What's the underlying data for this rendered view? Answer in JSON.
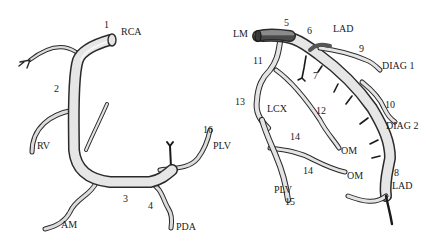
{
  "figure": {
    "left_panel": {
      "name": "right-coronary-artery",
      "labels": [
        {
          "id": "seg-1",
          "text": "1",
          "x": 104,
          "y": 24
        },
        {
          "id": "rca",
          "text": "RCA",
          "x": 121,
          "y": 30
        },
        {
          "id": "seg-2",
          "text": "2",
          "x": 54,
          "y": 85
        },
        {
          "id": "rv",
          "text": "RV",
          "x": 37,
          "y": 142
        },
        {
          "id": "seg-16",
          "text": "16",
          "x": 203,
          "y": 126
        },
        {
          "id": "plv",
          "text": "PLV",
          "x": 213,
          "y": 142
        },
        {
          "id": "seg-3",
          "text": "3",
          "x": 123,
          "y": 195
        },
        {
          "id": "seg-4",
          "text": "4",
          "x": 148,
          "y": 203
        },
        {
          "id": "am",
          "text": "AM",
          "x": 61,
          "y": 222
        },
        {
          "id": "pda",
          "text": "PDA",
          "x": 176,
          "y": 224
        }
      ]
    },
    "right_panel": {
      "name": "left-coronary-artery",
      "labels": [
        {
          "id": "lm",
          "text": "LM",
          "x": 233,
          "y": 30
        },
        {
          "id": "seg-5",
          "text": "5",
          "x": 284,
          "y": 20
        },
        {
          "id": "seg-6",
          "text": "6",
          "x": 307,
          "y": 27
        },
        {
          "id": "lad-top",
          "text": "LAD",
          "x": 333,
          "y": 25
        },
        {
          "id": "seg-9",
          "text": "9",
          "x": 359,
          "y": 45
        },
        {
          "id": "diag-1",
          "text": "DIAG 1",
          "x": 382,
          "y": 60
        },
        {
          "id": "seg-11",
          "text": "11",
          "x": 253,
          "y": 57
        },
        {
          "id": "seg-7",
          "text": "7",
          "x": 313,
          "y": 72
        },
        {
          "id": "seg-13",
          "text": "13",
          "x": 235,
          "y": 98
        },
        {
          "id": "lcx",
          "text": "LCX",
          "x": 267,
          "y": 104
        },
        {
          "id": "seg-12",
          "text": "12",
          "x": 316,
          "y": 106
        },
        {
          "id": "seg-10",
          "text": "10",
          "x": 385,
          "y": 101
        },
        {
          "id": "diag-2",
          "text": "DIAG 2",
          "x": 386,
          "y": 122
        },
        {
          "id": "seg-14-upper",
          "text": "14",
          "x": 290,
          "y": 134
        },
        {
          "id": "om-upper",
          "text": "OM",
          "x": 341,
          "y": 147
        },
        {
          "id": "seg-14-lower",
          "text": "14",
          "x": 303,
          "y": 167
        },
        {
          "id": "om-lower",
          "text": "OM",
          "x": 347,
          "y": 171
        },
        {
          "id": "seg-8",
          "text": "8",
          "x": 394,
          "y": 168
        },
        {
          "id": "lad-bottom",
          "text": "LAD",
          "x": 392,
          "y": 182
        },
        {
          "id": "plv-lower",
          "text": "PLV",
          "x": 274,
          "y": 186
        },
        {
          "id": "seg-15",
          "text": "15",
          "x": 285,
          "y": 198
        }
      ]
    },
    "colors": {
      "vessel_fill": "#e4e4e4",
      "vessel_outline": "#2a2a2a",
      "lm_fill": "#6e6e6e",
      "text": "#1a1a1a"
    }
  }
}
